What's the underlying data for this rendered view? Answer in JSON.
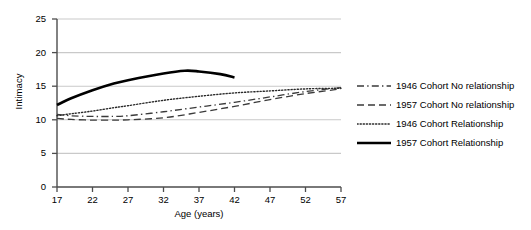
{
  "chart_data": {
    "type": "line",
    "title": "",
    "xlabel": "Age (years)",
    "ylabel": "Intimacy",
    "xlim": [
      17,
      57
    ],
    "ylim": [
      0,
      25
    ],
    "xticks": [
      17,
      22,
      27,
      32,
      37,
      42,
      47,
      52,
      57
    ],
    "yticks": [
      0,
      5,
      10,
      15,
      20,
      25
    ],
    "grid": "horizontal",
    "legend_position": "right",
    "series": [
      {
        "name": "1946 Cohort No relationship",
        "style": "dash-dot",
        "color": "#3a3a3a",
        "width": 1.3,
        "x": [
          17,
          19,
          22,
          25,
          27,
          32,
          37,
          42,
          47,
          52,
          57
        ],
        "values": [
          10.8,
          10.6,
          10.5,
          10.5,
          10.6,
          11.2,
          11.9,
          12.6,
          13.4,
          14.2,
          14.8
        ]
      },
      {
        "name": "1957 Cohort No relationship",
        "style": "dashed",
        "color": "#3a3a3a",
        "width": 1.3,
        "x": [
          17,
          19,
          22,
          25,
          27,
          32,
          37,
          42,
          47,
          52,
          57
        ],
        "values": [
          10.2,
          10.05,
          9.95,
          9.95,
          10.0,
          10.3,
          11.1,
          12.0,
          13.0,
          13.9,
          14.6
        ]
      },
      {
        "name": "1946 Cohort Relationship",
        "style": "dotted",
        "color": "#2a2a2a",
        "width": 1.4,
        "x": [
          17,
          19,
          22,
          25,
          27,
          32,
          37,
          42,
          47,
          52,
          57
        ],
        "values": [
          10.6,
          10.9,
          11.3,
          11.8,
          12.1,
          12.9,
          13.5,
          14.0,
          14.3,
          14.6,
          14.7
        ]
      },
      {
        "name": "1957 Cohort Relationship",
        "style": "solid",
        "color": "#000000",
        "width": 2.6,
        "x": [
          17,
          19,
          22,
          25,
          27,
          32,
          35,
          37,
          40,
          42
        ],
        "values": [
          12.2,
          13.2,
          14.4,
          15.4,
          15.9,
          16.9,
          17.3,
          17.2,
          16.8,
          16.3
        ]
      }
    ]
  },
  "legend": {
    "items": [
      {
        "label": "1946 Cohort No relationship",
        "style": "dash-dot"
      },
      {
        "label": "1957 Cohort No relationship",
        "style": "dashed"
      },
      {
        "label": "1946 Cohort Relationship",
        "style": "dotted"
      },
      {
        "label": "1957 Cohort Relationship",
        "style": "solid"
      }
    ]
  },
  "axes": {
    "y_title": "Intimacy",
    "x_title": "Age (years)",
    "y_tick_labels": [
      "25",
      "20",
      "15",
      "10",
      "5",
      "0"
    ],
    "x_tick_labels": [
      "17",
      "22",
      "27",
      "32",
      "37",
      "42",
      "47",
      "52",
      "57"
    ]
  },
  "colors": {
    "gridline": "#c9c9c9",
    "axis": "#4d4d4d",
    "text": "#111111",
    "background": "#ffffff"
  }
}
